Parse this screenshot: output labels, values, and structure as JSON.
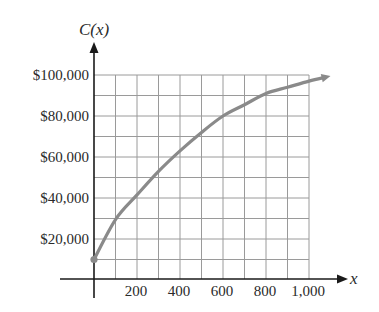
{
  "chart_data": {
    "type": "line",
    "title": "",
    "xlabel": "x",
    "ylabel": "C(x)",
    "x_ticks": [
      200,
      400,
      600,
      800,
      1000
    ],
    "x_tick_labels": [
      "200",
      "400",
      "600",
      "800",
      "1,000"
    ],
    "y_ticks": [
      20000,
      40000,
      60000,
      80000,
      100000
    ],
    "y_tick_labels": [
      "$20,000",
      "$40,000",
      "$60,000",
      "$80,000",
      "$100,000"
    ],
    "xlim": [
      0,
      1000
    ],
    "ylim": [
      0,
      100000
    ],
    "grid": true,
    "grid_x_step": 100,
    "grid_y_step": 10000,
    "legend": null,
    "series": [
      {
        "name": "C(x)",
        "x": [
          0,
          100,
          200,
          300,
          400,
          500,
          600,
          700,
          800,
          900,
          1000,
          1100
        ],
        "values": [
          10000,
          29500,
          41500,
          53000,
          63000,
          72000,
          80000,
          85500,
          91000,
          94000,
          97000,
          99500
        ],
        "start_point_marker": true,
        "end_arrow": true
      }
    ],
    "colors": {
      "curve": "#8a8a8a",
      "grid": "#9a9a9a",
      "axis": "#1a1a1a",
      "text": "#2a2a2a"
    }
  }
}
